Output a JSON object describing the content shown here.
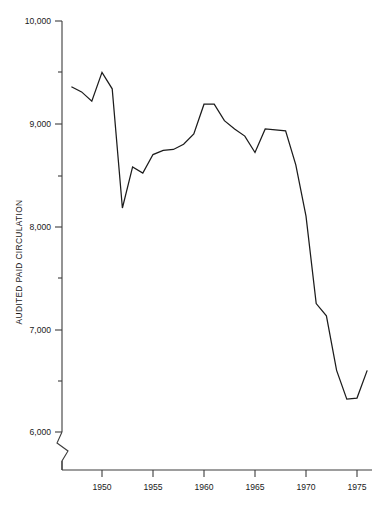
{
  "chart_data": {
    "type": "line",
    "title": "",
    "xlabel": "",
    "ylabel": "AUDITED PAID CIRCULATION",
    "xlim": [
      1946.5,
      1976.5
    ],
    "ylim": [
      5800,
      10000
    ],
    "grid": false,
    "legend": null,
    "axis_break": true,
    "axis_break_note": "y-axis broken below 6,000",
    "y_ticks_major": [
      6000,
      7000,
      8000,
      9000,
      10000
    ],
    "y_tick_labels": [
      "6,000",
      "7,000",
      "8,000",
      "9,000",
      "10,000"
    ],
    "y_ticks_minor": [
      6500,
      7500,
      8500,
      9500
    ],
    "x_ticks": [
      1950,
      1955,
      1960,
      1965,
      1970,
      1975
    ],
    "x_tick_labels": [
      "1950",
      "1955",
      "1960",
      "1965",
      "1970",
      "1975"
    ],
    "x": [
      1947,
      1948,
      1949,
      1950,
      1951,
      1952,
      1953,
      1954,
      1955,
      1956,
      1957,
      1958,
      1959,
      1960,
      1961,
      1962,
      1963,
      1964,
      1965,
      1966,
      1967,
      1968,
      1969,
      1970,
      1971,
      1972,
      1973,
      1974,
      1975,
      1976
    ],
    "values": [
      9360,
      9310,
      9220,
      9500,
      9340,
      8180,
      8580,
      8520,
      8700,
      8740,
      8750,
      8800,
      8900,
      9190,
      9190,
      9030,
      8950,
      8880,
      8720,
      8950,
      8940,
      8930,
      8600,
      8100,
      7250,
      7130,
      6600,
      6320,
      6330,
      6600
    ],
    "series": [
      {
        "name": "Audited paid circulation",
        "color": "#1c1c1c",
        "values": [
          9360,
          9310,
          9220,
          9500,
          9340,
          8180,
          8580,
          8520,
          8700,
          8740,
          8750,
          8800,
          8900,
          9190,
          9190,
          9030,
          8950,
          8880,
          8720,
          8950,
          8940,
          8930,
          8600,
          8100,
          7250,
          7130,
          6600,
          6320,
          6330,
          6600
        ]
      }
    ]
  },
  "axes": {
    "y_label_text": "AUDITED PAID CIRCULATION"
  }
}
